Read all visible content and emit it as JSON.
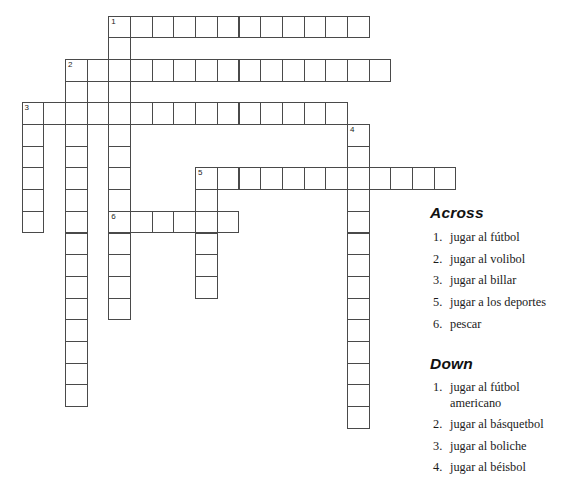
{
  "puzzle": {
    "cell_size": 21.7,
    "origin_x": 21.5,
    "origin_y": 15.5,
    "words": [
      {
        "number": 1,
        "direction": "across",
        "row": 0,
        "col": 4,
        "length": 12
      },
      {
        "number": 1,
        "direction": "down",
        "row": 0,
        "col": 4,
        "length": 14
      },
      {
        "number": 2,
        "direction": "across",
        "row": 2,
        "col": 2,
        "length": 15
      },
      {
        "number": 2,
        "direction": "down",
        "row": 2,
        "col": 2,
        "length": 16
      },
      {
        "number": 3,
        "direction": "across",
        "row": 4,
        "col": 0,
        "length": 15
      },
      {
        "number": 3,
        "direction": "down",
        "row": 4,
        "col": 0,
        "length": 6
      },
      {
        "number": 4,
        "direction": "down",
        "row": 5,
        "col": 15,
        "length": 14
      },
      {
        "number": 5,
        "direction": "across",
        "row": 7,
        "col": 8,
        "length": 12
      },
      {
        "number": 5,
        "direction": "down",
        "row": 7,
        "col": 8,
        "length": 6
      },
      {
        "number": 6,
        "direction": "across",
        "row": 9,
        "col": 4,
        "length": 6
      }
    ]
  },
  "clues": {
    "across_heading": "Across",
    "down_heading": "Down",
    "across": [
      {
        "number": "1.",
        "text": "jugar al fútbol"
      },
      {
        "number": "2.",
        "text": "jugar al volibol"
      },
      {
        "number": "3.",
        "text": "jugar al billar"
      },
      {
        "number": "5.",
        "text": "jugar a los deportes"
      },
      {
        "number": "6.",
        "text": "pescar"
      }
    ],
    "down": [
      {
        "number": "1.",
        "text": "jugar al fútbol",
        "text2": "americano"
      },
      {
        "number": "2.",
        "text": "jugar al básquetbol"
      },
      {
        "number": "3.",
        "text": "jugar al boliche"
      },
      {
        "number": "4.",
        "text": "jugar al béisbol"
      }
    ]
  }
}
